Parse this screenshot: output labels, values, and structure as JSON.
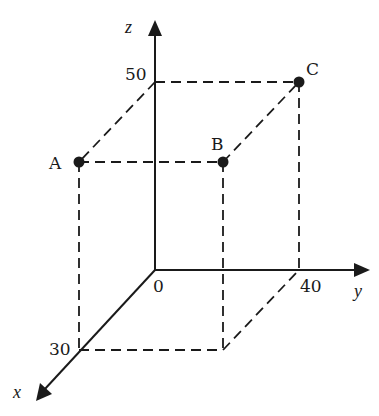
{
  "diagram": {
    "type": "3d-coordinate-box",
    "axes": {
      "x": {
        "label": "x",
        "tick_value": "30"
      },
      "y": {
        "label": "y",
        "tick_value": "40"
      },
      "z": {
        "label": "z",
        "tick_value": "50"
      },
      "origin_label": "0"
    },
    "points": [
      {
        "name": "A",
        "coords": [
          30,
          0,
          50
        ]
      },
      {
        "name": "B",
        "coords": [
          30,
          40,
          50
        ]
      },
      {
        "name": "C",
        "coords": [
          0,
          40,
          50
        ]
      }
    ],
    "box_dimensions": {
      "x": 30,
      "y": 40,
      "z": 50
    },
    "line_style": {
      "axes": "solid",
      "edges": "dashed"
    },
    "colors": {
      "ink": "#1a1a1a",
      "background": "#ffffff"
    }
  }
}
